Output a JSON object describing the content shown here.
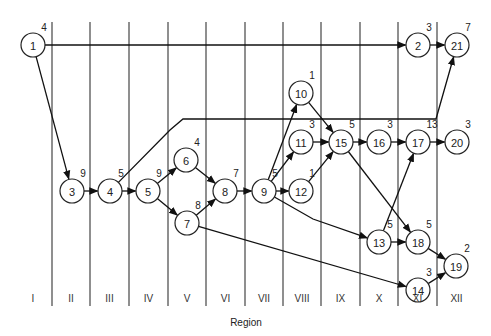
{
  "diagram": {
    "axis_title": "Region",
    "regions": [
      "I",
      "II",
      "III",
      "IV",
      "V",
      "VI",
      "VII",
      "VIII",
      "IX",
      "X",
      "XI",
      "XII"
    ],
    "region_dividers_x": [
      52,
      90,
      129,
      168,
      206,
      245,
      283,
      321,
      360,
      398,
      437
    ],
    "nodes": [
      {
        "id": "1",
        "x": 33,
        "y": 45,
        "weight": "4"
      },
      {
        "id": "2",
        "x": 418,
        "y": 45,
        "weight": "3"
      },
      {
        "id": "21",
        "x": 457,
        "y": 45,
        "weight": "7"
      },
      {
        "id": "3",
        "x": 72,
        "y": 191,
        "weight": "9"
      },
      {
        "id": "4",
        "x": 110,
        "y": 191,
        "weight": "5"
      },
      {
        "id": "5",
        "x": 148,
        "y": 191,
        "weight": "9"
      },
      {
        "id": "6",
        "x": 186,
        "y": 160,
        "weight": "4"
      },
      {
        "id": "7",
        "x": 187,
        "y": 223,
        "weight": "8"
      },
      {
        "id": "8",
        "x": 225,
        "y": 191,
        "weight": "7"
      },
      {
        "id": "9",
        "x": 264,
        "y": 191,
        "weight": "5"
      },
      {
        "id": "10",
        "x": 301,
        "y": 93,
        "weight": "1"
      },
      {
        "id": "11",
        "x": 301,
        "y": 142,
        "weight": "3"
      },
      {
        "id": "12",
        "x": 301,
        "y": 191,
        "weight": "1"
      },
      {
        "id": "15",
        "x": 341,
        "y": 142,
        "weight": "5"
      },
      {
        "id": "16",
        "x": 379,
        "y": 142,
        "weight": "3"
      },
      {
        "id": "17",
        "x": 418,
        "y": 142,
        "weight": "13"
      },
      {
        "id": "20",
        "x": 457,
        "y": 142,
        "weight": "3"
      },
      {
        "id": "13",
        "x": 379,
        "y": 242,
        "weight": "5"
      },
      {
        "id": "18",
        "x": 418,
        "y": 242,
        "weight": "5"
      },
      {
        "id": "19",
        "x": 456,
        "y": 266,
        "weight": "2"
      },
      {
        "id": "14",
        "x": 418,
        "y": 290,
        "weight": "3"
      }
    ],
    "edges": [
      {
        "from": "1",
        "to": "2"
      },
      {
        "from": "2",
        "to": "21"
      },
      {
        "from": "1",
        "to": "3"
      },
      {
        "from": "3",
        "to": "4"
      },
      {
        "from": "4",
        "to": "21",
        "via": [
          [
            170,
            130
          ],
          [
            183,
            119
          ],
          [
            436,
            119
          ]
        ]
      },
      {
        "from": "4",
        "to": "5"
      },
      {
        "from": "5",
        "to": "6"
      },
      {
        "from": "5",
        "to": "7"
      },
      {
        "from": "6",
        "to": "8"
      },
      {
        "from": "7",
        "to": "8"
      },
      {
        "from": "7",
        "to": "14"
      },
      {
        "from": "8",
        "to": "9"
      },
      {
        "from": "9",
        "to": "10"
      },
      {
        "from": "9",
        "to": "11"
      },
      {
        "from": "9",
        "to": "12"
      },
      {
        "from": "9",
        "to": "13",
        "via": [
          [
            313,
            219
          ]
        ]
      },
      {
        "from": "10",
        "to": "15"
      },
      {
        "from": "11",
        "to": "15"
      },
      {
        "from": "12",
        "to": "15"
      },
      {
        "from": "15",
        "to": "16"
      },
      {
        "from": "15",
        "to": "18"
      },
      {
        "from": "16",
        "to": "17"
      },
      {
        "from": "17",
        "to": "20"
      },
      {
        "from": "13",
        "to": "17"
      },
      {
        "from": "13",
        "to": "18"
      },
      {
        "from": "18",
        "to": "19"
      },
      {
        "from": "14",
        "to": "19"
      }
    ],
    "colors": {
      "line": "#111111",
      "node_fill": "#ffffff",
      "background": "#ffffff"
    }
  }
}
